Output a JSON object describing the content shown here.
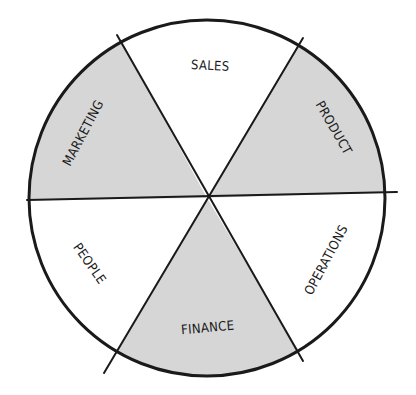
{
  "diagram": {
    "type": "segmented-wheel",
    "center": [
      207,
      198
    ],
    "radius": 178,
    "colors": {
      "shaded": "#d6d6d6",
      "unshaded": "#ffffff",
      "stroke": "#1a1a1a"
    },
    "segments": [
      {
        "label": "SALES",
        "shaded": false
      },
      {
        "label": "PRODUCT",
        "shaded": true
      },
      {
        "label": "OPERATIONS",
        "shaded": false
      },
      {
        "label": "FINANCE",
        "shaded": true
      },
      {
        "label": "PEOPLE",
        "shaded": false
      },
      {
        "label": "MARKETING",
        "shaded": true
      }
    ]
  }
}
